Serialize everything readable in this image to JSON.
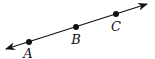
{
  "diagram": {
    "type": "line-through-points",
    "line_color": "#111111",
    "points": [
      {
        "label": "A"
      },
      {
        "label": "B"
      },
      {
        "label": "C"
      }
    ]
  }
}
